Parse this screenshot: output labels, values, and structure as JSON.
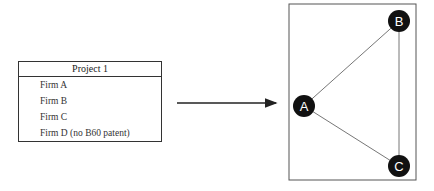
{
  "table": {
    "header": "Project 1",
    "rows": [
      "Firm A",
      "Firm B",
      "Firm C",
      "Firm D (no B60 patent)"
    ]
  },
  "graph": {
    "nodes": [
      {
        "label": "A",
        "x": 304,
        "y": 106
      },
      {
        "label": "B",
        "x": 399,
        "y": 21
      },
      {
        "label": "C",
        "x": 399,
        "y": 166
      }
    ],
    "edges": [
      [
        "A",
        "B"
      ],
      [
        "A",
        "C"
      ],
      [
        "B",
        "C"
      ]
    ]
  }
}
